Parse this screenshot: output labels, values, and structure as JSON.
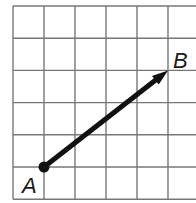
{
  "diagram": {
    "type": "vector-on-grid",
    "grid": {
      "columns": 6,
      "rows": 6,
      "origin_x": 13,
      "origin_y": 6,
      "cell_width": 31,
      "cell_height": 32.2,
      "line_color": "#777777",
      "right_edge_visible": false
    },
    "vector": {
      "start": {
        "label": "A",
        "grid_col": 1,
        "grid_row": 5
      },
      "end": {
        "label": "B",
        "grid_col": 5,
        "grid_row": 2
      },
      "color": "#111111",
      "components": {
        "dx": 4,
        "dy": 3
      }
    },
    "labels": {
      "start": "A",
      "end": "B"
    }
  }
}
